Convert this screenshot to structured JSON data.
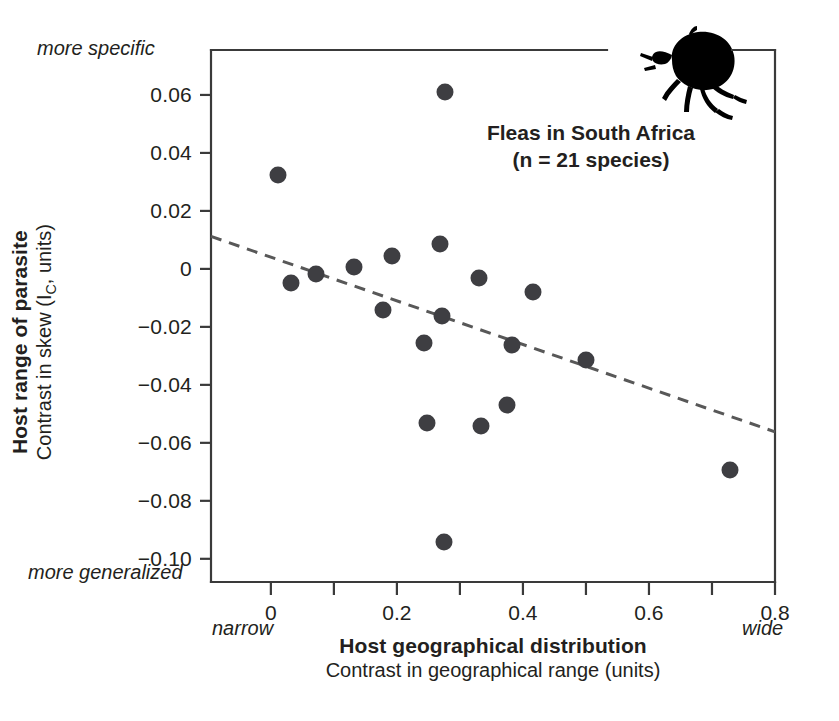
{
  "chart_data": {
    "type": "scatter",
    "title": "",
    "annotation": {
      "line1": "Fleas in South Africa",
      "line2": "(n = 21 species)",
      "icon": "flea-silhouette-icon"
    },
    "xlabel": "Host geographical distribution",
    "xlabel_sub": "Contrast in geographical range (units)",
    "ylabel": "Host range of parasite",
    "ylabel_sub_pre": "Contrast in skew (I",
    "ylabel_sub_sub": "C",
    "ylabel_sub_post": ", units)",
    "x_end_low": "narrow",
    "x_end_high": "wide",
    "y_end_high": "more specific",
    "y_end_low": "more generalized",
    "xlim": [
      -0.095,
      0.8
    ],
    "ylim": [
      -0.108,
      0.0755
    ],
    "xticks": [
      0,
      0.2,
      0.4,
      0.6,
      0.8
    ],
    "xtick_labels": [
      "0",
      "0.2",
      "0.4",
      "0.6",
      "0.8"
    ],
    "x_minor_ticks": [
      0.1,
      0.3,
      0.5,
      0.7
    ],
    "yticks": [
      0.06,
      0.04,
      0.02,
      0,
      -0.02,
      -0.04,
      -0.06,
      -0.08,
      -0.1
    ],
    "ytick_labels": [
      "0.06",
      "0.04",
      "0.02",
      "0",
      "−0.02",
      "−0.04",
      "−0.06",
      "−0.08",
      "−0.10"
    ],
    "grid": false,
    "legend": "none",
    "marker_color": "#3e3e42",
    "marker_size_px": 17,
    "points": [
      {
        "x": 0.012,
        "y": 0.0325
      },
      {
        "x": 0.032,
        "y": -0.0048
      },
      {
        "x": 0.072,
        "y": -0.0018
      },
      {
        "x": 0.132,
        "y": 0.0007
      },
      {
        "x": 0.178,
        "y": -0.0143
      },
      {
        "x": 0.192,
        "y": 0.0046
      },
      {
        "x": 0.243,
        "y": -0.0257
      },
      {
        "x": 0.247,
        "y": -0.0533
      },
      {
        "x": 0.268,
        "y": 0.0085
      },
      {
        "x": 0.272,
        "y": -0.0163
      },
      {
        "x": 0.277,
        "y": 0.0609
      },
      {
        "x": 0.275,
        "y": -0.0943
      },
      {
        "x": 0.331,
        "y": -0.0033
      },
      {
        "x": 0.333,
        "y": -0.0543
      },
      {
        "x": 0.374,
        "y": -0.0468
      },
      {
        "x": 0.383,
        "y": -0.0262
      },
      {
        "x": 0.416,
        "y": -0.0079
      },
      {
        "x": 0.5,
        "y": -0.0315
      },
      {
        "x": 0.728,
        "y": -0.0692
      }
    ],
    "trendline": {
      "style": "dashed",
      "color": "#585858",
      "x_start": -0.095,
      "y_start": 0.0112,
      "x_end": 0.8,
      "y_end": -0.0562
    }
  }
}
